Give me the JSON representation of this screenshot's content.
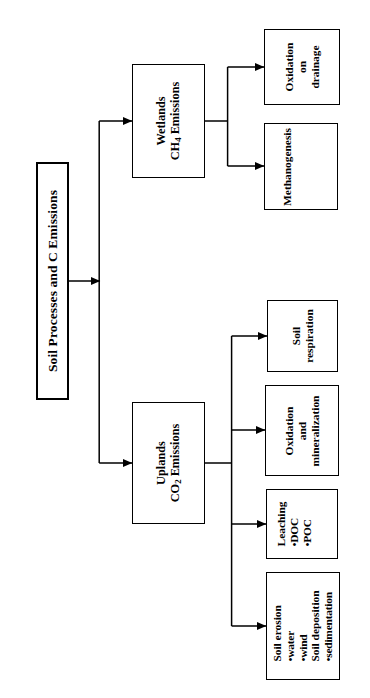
{
  "diagram": {
    "title": "Soil Processes and C Emissions",
    "type": "flowchart",
    "orientation": "rotated-90-ccw",
    "root": {
      "label": "Soil Processes and C Emissions"
    },
    "branches": [
      {
        "id": "wetlands",
        "line1": "Wetlands",
        "line2_prefix": "CH",
        "line2_subscript": "4",
        "line2_suffix": " Emissions",
        "children": [
          "oxidation-on-drainage",
          "methanogenesis"
        ]
      },
      {
        "id": "uplands",
        "line1": "Uplands",
        "line2_prefix": "CO",
        "line2_subscript": "2",
        "line2_suffix": " Emissions",
        "children": [
          "soil-respiration",
          "oxidation-and-mineralization",
          "leaching",
          "soil-erosion-deposition"
        ]
      }
    ],
    "leaves": [
      {
        "id": "oxidation-on-drainage",
        "lines": [
          "Oxidation",
          "on",
          "drainage"
        ]
      },
      {
        "id": "methanogenesis",
        "lines": [
          "Methanogenesis"
        ]
      },
      {
        "id": "soil-respiration",
        "lines": [
          "Soil",
          "respiration"
        ]
      },
      {
        "id": "oxidation-and-mineralization",
        "lines": [
          "Oxidation",
          "and",
          "mineralization"
        ]
      },
      {
        "id": "leaching",
        "lines": [
          "Leaching",
          "•DOC",
          "•POC"
        ]
      },
      {
        "id": "soil-erosion-deposition",
        "lines": [
          "Soil erosion",
          "•water",
          "•wind",
          "Soil deposition",
          "•sedimentation"
        ]
      }
    ],
    "colors": {
      "stroke": "#000000",
      "background": "#ffffff"
    }
  }
}
